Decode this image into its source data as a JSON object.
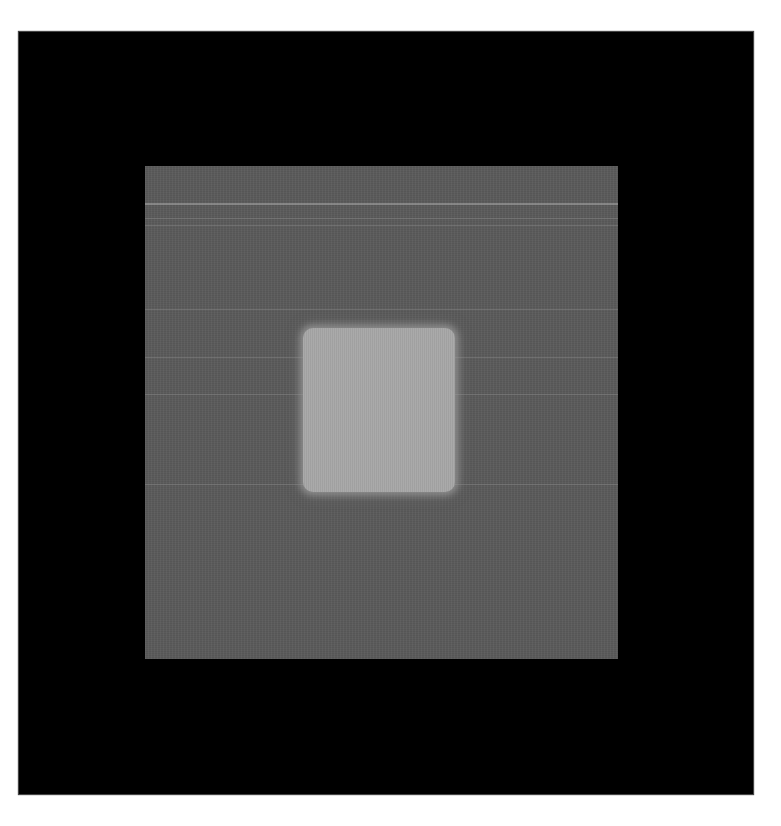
{
  "image": {
    "description": "Grayscale detector-style image: black field containing a mid-gray square with horizontal scan lines and a bright blurred square at center",
    "colors": {
      "page_background": "#ffffff",
      "outer_field": "#000000",
      "gray_square": "#5b5b5b",
      "inner_square": "#a7a7a7",
      "scan_lines": "#9a9a9a"
    },
    "regions": {
      "outer_field": {
        "x": 19,
        "y": 32,
        "width": 734,
        "height": 762
      },
      "gray_square": {
        "x": 145,
        "y": 166,
        "width": 473,
        "height": 493
      },
      "inner_square": {
        "x": 303,
        "y": 328,
        "width": 152,
        "height": 164
      }
    },
    "scan_line_y_positions": [
      203,
      218,
      225,
      309,
      357,
      394,
      484
    ]
  }
}
